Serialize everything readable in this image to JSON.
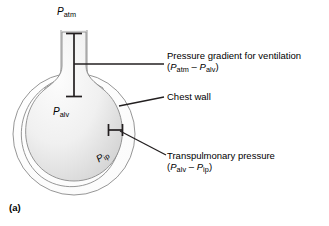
{
  "figure": {
    "panel_letter": "(a)",
    "background_color": "#ffffff",
    "line_color": "#231f20",
    "outline_color": "#808080",
    "fill_light": "#fcfcfc",
    "fill_dark": "#d8d8d8"
  },
  "diagram_labels": {
    "p_atm": {
      "symbol": "P",
      "subscript": "atm"
    },
    "p_alv": {
      "symbol": "P",
      "subscript": "alv"
    },
    "p_ip": {
      "symbol": "P",
      "subscript": "ip"
    }
  },
  "callouts": [
    {
      "name": "pressure-gradient",
      "title": "Pressure gradient for ventilation",
      "formula_open": "(",
      "formula_symbol_a": "P",
      "formula_sub_a": "atm",
      "formula_operator": " – ",
      "formula_symbol_b": "P",
      "formula_sub_b": "alv",
      "formula_close": ")"
    },
    {
      "name": "chest-wall",
      "title": "Chest wall"
    },
    {
      "name": "transpulmonary-pressure",
      "title": "Transpulmonary pressure",
      "formula_open": "(",
      "formula_symbol_a": "P",
      "formula_sub_a": "alv",
      "formula_operator": " – ",
      "formula_symbol_b": "P",
      "formula_sub_b": "ip",
      "formula_close": ")"
    }
  ]
}
